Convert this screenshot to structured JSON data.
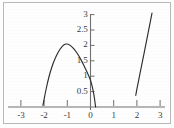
{
  "chart_data": {
    "type": "line",
    "title": "",
    "subtitle": "",
    "xlabel": "",
    "ylabel": "",
    "xlim": [
      -3.35,
      3.35
    ],
    "ylim": [
      0,
      3.25
    ],
    "grid": false,
    "legend": null,
    "axis_style": "crossing-axes-at-origin",
    "x_ticks": [
      -3,
      -2,
      -1,
      0,
      1,
      2,
      3
    ],
    "x_tick_labels": [
      "-3",
      "-2",
      "-1",
      "0",
      "1",
      "2",
      "3"
    ],
    "y_ticks": [
      0.5,
      1,
      1.5,
      2,
      2.5,
      3
    ],
    "y_tick_labels": [
      "0.5",
      "1",
      "1.5",
      "2",
      "2.5",
      "3"
    ],
    "series": [
      {
        "name": "left-branch",
        "description": "downward-opening parabola-like arc peaking near (-1.05, 2.05), descending to the x-axis near x=-2.05 on the left and crossing just right of the origin near x=0.2",
        "points": [
          [
            -2.05,
            0.05
          ],
          [
            -1.95,
            0.45
          ],
          [
            -1.85,
            0.8
          ],
          [
            -1.75,
            1.1
          ],
          [
            -1.6,
            1.45
          ],
          [
            -1.45,
            1.7
          ],
          [
            -1.3,
            1.9
          ],
          [
            -1.15,
            2.02
          ],
          [
            -1.05,
            2.05
          ],
          [
            -0.95,
            2.04
          ],
          [
            -0.8,
            1.96
          ],
          [
            -0.65,
            1.83
          ],
          [
            -0.5,
            1.66
          ],
          [
            -0.35,
            1.45
          ],
          [
            -0.2,
            1.22
          ],
          [
            -0.1,
            1.05
          ],
          [
            0.0,
            0.88
          ],
          [
            0.08,
            0.65
          ],
          [
            0.15,
            0.4
          ],
          [
            0.2,
            0.12
          ],
          [
            0.22,
            0.0
          ]
        ]
      },
      {
        "name": "right-branch",
        "description": "steep, nearly straight rising curve from about (1.95, 0.38) up to (2.65, 3.05)",
        "points": [
          [
            1.95,
            0.38
          ],
          [
            2.05,
            0.78
          ],
          [
            2.15,
            1.15
          ],
          [
            2.25,
            1.52
          ],
          [
            2.35,
            1.9
          ],
          [
            2.45,
            2.28
          ],
          [
            2.55,
            2.66
          ],
          [
            2.65,
            3.05
          ]
        ]
      }
    ]
  },
  "figure": {
    "border_color": "#b9b9b9",
    "axis_color": "#6f6f6f",
    "curve_color": "#2e2e2e",
    "background_color": "#fefefe",
    "tick_label_color": "#3a3a3a"
  }
}
